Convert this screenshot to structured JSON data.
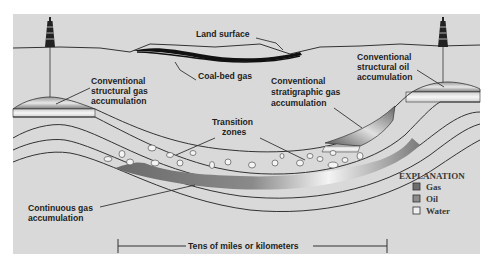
{
  "labels": {
    "land_surface": "Land surface",
    "coal_bed_gas": "Coal-bed gas",
    "conv_struct_gas": [
      "Conventional",
      "structural gas",
      "accumulation"
    ],
    "conv_struct_oil": [
      "Conventional",
      "structural oil",
      "accumulation"
    ],
    "conv_strat_gas": [
      "Conventional",
      "stratigraphic gas",
      "accumulation"
    ],
    "transition_zones": [
      "Transition",
      "zones"
    ],
    "continuous_gas": [
      "Continuous gas",
      "accumulation"
    ],
    "scale_bar": "Tens of miles or kilometers"
  },
  "explanation": {
    "title": "EXPLANATION",
    "items": [
      {
        "label": "Gas",
        "color": "#6e6e6e"
      },
      {
        "label": "Oil",
        "color": "#8c8c8c"
      },
      {
        "label": "Water",
        "color": "#f0f0f0"
      }
    ]
  },
  "icons": {
    "left_rig": "oil-derrick-icon",
    "right_rig": "oil-derrick-icon"
  },
  "colors": {
    "background": "#d9d9d9",
    "frame_bg": "#ffffff",
    "stroke": "#333333",
    "gas": "#6e6e6e",
    "oil": "#8c8c8c",
    "water": "#f0f0f0"
  }
}
